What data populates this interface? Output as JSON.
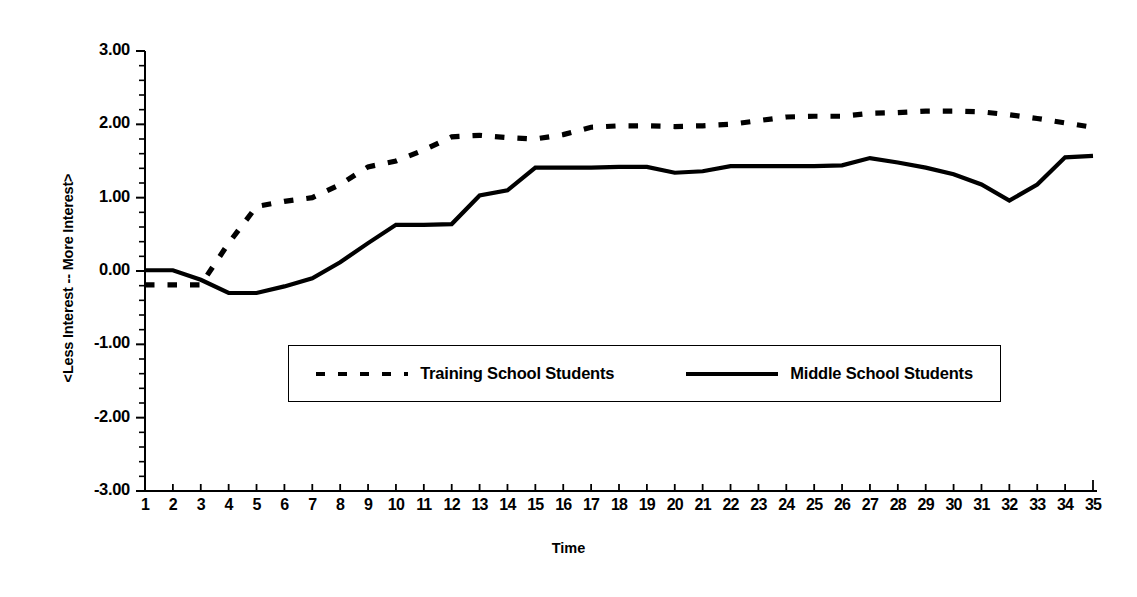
{
  "chart_data": {
    "type": "line",
    "title": "",
    "xlabel": "Time",
    "ylabel": "<Less Interest  --  More Interest>",
    "xlim": [
      1,
      35
    ],
    "ylim": [
      -3.0,
      3.0
    ],
    "grid": false,
    "legend_position": "inside-lower-center",
    "y_tick_labels": [
      "3.00",
      "2.00",
      "1.00",
      "0.00",
      "-1.00",
      "-2.00",
      "-3.00"
    ],
    "y_tick_values": [
      3.0,
      2.0,
      1.0,
      0.0,
      -1.0,
      -2.0,
      -3.0
    ],
    "minor_ticks_per_interval": 4,
    "x": [
      1,
      2,
      3,
      4,
      5,
      6,
      7,
      8,
      9,
      10,
      11,
      12,
      13,
      14,
      15,
      16,
      17,
      18,
      19,
      20,
      21,
      22,
      23,
      24,
      25,
      26,
      27,
      28,
      29,
      30,
      31,
      32,
      33,
      34,
      35
    ],
    "x_tick_labels": [
      "1",
      "2",
      "3",
      "4",
      "5",
      "6",
      "7",
      "8",
      "9",
      "10",
      "11",
      "12",
      "13",
      "14",
      "15",
      "16",
      "17",
      "18",
      "19",
      "20",
      "21",
      "22",
      "23",
      "24",
      "25",
      "26",
      "27",
      "28",
      "29",
      "30",
      "31",
      "32",
      "33",
      "34",
      "35"
    ],
    "series": [
      {
        "name": "Training School Students",
        "style": "dashed",
        "color": "#000000",
        "values": [
          -0.19,
          -0.19,
          -0.19,
          0.38,
          0.88,
          0.95,
          1.0,
          1.18,
          1.42,
          1.5,
          1.65,
          1.83,
          1.85,
          1.82,
          1.8,
          1.86,
          1.96,
          1.98,
          1.98,
          1.97,
          1.98,
          2.0,
          2.05,
          2.1,
          2.11,
          2.11,
          2.15,
          2.16,
          2.18,
          2.18,
          2.17,
          2.13,
          2.08,
          2.02,
          1.96
        ]
      },
      {
        "name": "Middle School Students",
        "style": "solid",
        "color": "#000000",
        "values": [
          0.01,
          0.01,
          -0.12,
          -0.3,
          -0.3,
          -0.21,
          -0.1,
          0.12,
          0.38,
          0.63,
          0.63,
          0.64,
          1.03,
          1.1,
          1.41,
          1.41,
          1.41,
          1.42,
          1.42,
          1.34,
          1.36,
          1.43,
          1.43,
          1.43,
          1.43,
          1.44,
          1.54,
          1.48,
          1.41,
          1.32,
          1.18,
          0.96,
          1.18,
          1.55,
          1.57
        ]
      }
    ]
  },
  "axis": {
    "x_title": "Time",
    "y_title": "<Less Interest  --  More Interest>"
  },
  "legend": {
    "entries": [
      {
        "label": "Training School Students",
        "style": "dashed"
      },
      {
        "label": "Middle School Students",
        "style": "solid"
      }
    ]
  }
}
